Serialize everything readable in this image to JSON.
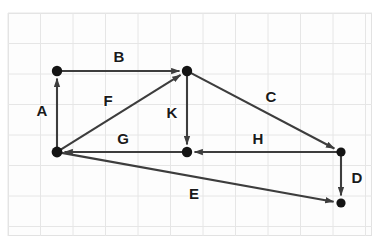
{
  "diagram": {
    "type": "directed-graph",
    "colors": {
      "background": "#ffffff",
      "grid_line": "#e6e6e6",
      "grid_border": "#e2e2e2",
      "edge": "#3d3d3d",
      "node": "#141414",
      "label": "#1a1a1a"
    },
    "grid": {
      "left": 8,
      "top": 13,
      "width": 364,
      "height": 223,
      "cell_width": 32.5,
      "cell_height": 30.5,
      "visible": true
    },
    "nodes": [
      {
        "id": "n1",
        "name": "top-left-node",
        "x": 57,
        "y": 71,
        "r": 5.2
      },
      {
        "id": "n2",
        "name": "top-middle-node",
        "x": 187,
        "y": 71,
        "r": 5.2
      },
      {
        "id": "n3",
        "name": "bottom-left-node",
        "x": 57,
        "y": 152,
        "r": 5.4
      },
      {
        "id": "n4",
        "name": "middle-node",
        "x": 187,
        "y": 152,
        "r": 5.2
      },
      {
        "id": "n5",
        "name": "right-node",
        "x": 341,
        "y": 152,
        "r": 4.6
      },
      {
        "id": "n6",
        "name": "bottom-right-node",
        "x": 341,
        "y": 203,
        "r": 4.6
      }
    ],
    "edges": [
      {
        "id": "A",
        "label": "A",
        "from": "n3",
        "to": "n1",
        "label_x": 42,
        "label_y": 110
      },
      {
        "id": "B",
        "label": "B",
        "from": "n1",
        "to": "n2",
        "label_x": 119,
        "label_y": 56
      },
      {
        "id": "C",
        "label": "C",
        "from": "n2",
        "to": "n5",
        "label_x": 271,
        "label_y": 96
      },
      {
        "id": "D",
        "label": "D",
        "from": "n5",
        "to": "n6",
        "label_x": 357,
        "label_y": 177
      },
      {
        "id": "E",
        "label": "E",
        "from": "n3",
        "to": "n6",
        "label_x": 194,
        "label_y": 193
      },
      {
        "id": "F",
        "label": "F",
        "from": "n3",
        "to": "n2",
        "label_x": 108,
        "label_y": 100
      },
      {
        "id": "G",
        "label": "G",
        "from": "n4",
        "to": "n3",
        "label_x": 123,
        "label_y": 138
      },
      {
        "id": "H",
        "label": "H",
        "from": "n5",
        "to": "n4",
        "label_x": 258,
        "label_y": 138
      },
      {
        "id": "K",
        "label": "K",
        "from": "n2",
        "to": "n4",
        "label_x": 172,
        "label_y": 112
      }
    ]
  }
}
